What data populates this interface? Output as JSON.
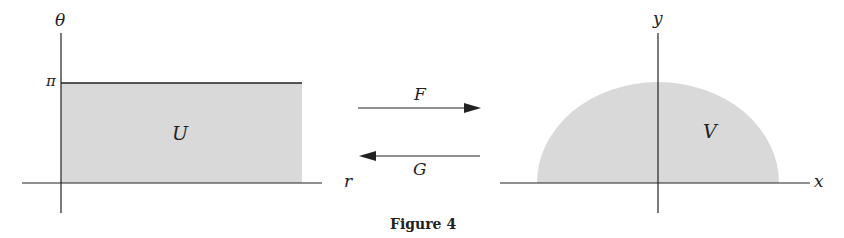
{
  "figure": {
    "caption": "Figure 4",
    "left_panel": {
      "axis_vertical_label": "θ",
      "axis_horizontal_label": "r",
      "tick_label": "π",
      "region_label": "U"
    },
    "right_panel": {
      "axis_vertical_label": "y",
      "axis_horizontal_label": "x",
      "region_label": "V"
    },
    "maps": {
      "forward_label": "F",
      "backward_label": "G"
    },
    "colors": {
      "region_fill": "#d9d9d9",
      "line": "#222222"
    }
  }
}
